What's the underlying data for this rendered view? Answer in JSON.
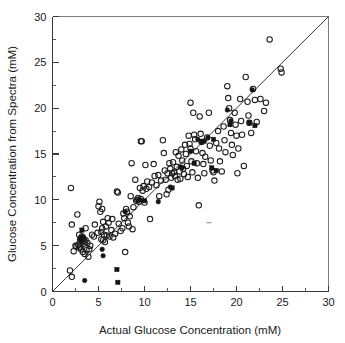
{
  "chart_data": {
    "type": "scatter",
    "title": "",
    "xlabel": "Actual Glucose Concentration (mM)",
    "ylabel": "Glucose Concentration from Spectra (mM)",
    "xlim": [
      0,
      30
    ],
    "ylim": [
      0,
      30
    ],
    "xticks": [
      0,
      5,
      10,
      15,
      20,
      25,
      30
    ],
    "yticks": [
      0,
      5,
      10,
      15,
      20,
      25,
      30
    ],
    "xtick_labels": [
      "0",
      "5",
      "10",
      "15",
      "20",
      "25",
      "30"
    ],
    "ytick_labels": [
      "0",
      "5",
      "10",
      "15",
      "20",
      "25",
      "30"
    ],
    "minor_tick_step": 2.5,
    "grid": false,
    "legend": false,
    "reference_line": {
      "name": "identity-line",
      "type": "line",
      "from": [
        0,
        0
      ],
      "to": [
        30,
        30
      ],
      "slope": 1,
      "intercept": 0,
      "color": "#2b2b2b"
    },
    "series": [
      {
        "name": "open-circle",
        "marker": "open circle",
        "color": "#1c1c1c",
        "points": [
          [
            1.9,
            2.3
          ],
          [
            2.1,
            1.6
          ],
          [
            2.0,
            11.3
          ],
          [
            2.1,
            7.3
          ],
          [
            2.3,
            4.4
          ],
          [
            2.5,
            5.0
          ],
          [
            2.6,
            4.9
          ],
          [
            2.7,
            8.4
          ],
          [
            2.8,
            5.1
          ],
          [
            2.9,
            4.8
          ],
          [
            2.9,
            6.2
          ],
          [
            3.0,
            4.9
          ],
          [
            3.0,
            5.6
          ],
          [
            3.1,
            5.8
          ],
          [
            3.1,
            4.6
          ],
          [
            3.2,
            5.5
          ],
          [
            3.2,
            6.0
          ],
          [
            3.3,
            5.9
          ],
          [
            3.3,
            4.3
          ],
          [
            3.4,
            5.2
          ],
          [
            3.4,
            5.7
          ],
          [
            3.5,
            5.4
          ],
          [
            3.5,
            4.1
          ],
          [
            3.6,
            5.6
          ],
          [
            3.6,
            6.9
          ],
          [
            3.7,
            4.5
          ],
          [
            3.8,
            5.3
          ],
          [
            3.9,
            3.8
          ],
          [
            4.0,
            4.6
          ],
          [
            4.1,
            5.0
          ],
          [
            4.3,
            6.2
          ],
          [
            4.5,
            6.0
          ],
          [
            4.6,
            7.3
          ],
          [
            4.9,
            6.4
          ],
          [
            5.0,
            9.3
          ],
          [
            5.1,
            9.8
          ],
          [
            5.2,
            8.7
          ],
          [
            5.3,
            6.5
          ],
          [
            5.3,
            5.7
          ],
          [
            5.4,
            9.0
          ],
          [
            5.4,
            6.9
          ],
          [
            5.5,
            7.6
          ],
          [
            5.5,
            5.6
          ],
          [
            5.6,
            6.2
          ],
          [
            5.7,
            5.4
          ],
          [
            5.8,
            7.1
          ],
          [
            5.9,
            6.1
          ],
          [
            6.0,
            8.0
          ],
          [
            6.1,
            7.5
          ],
          [
            6.2,
            6.0
          ],
          [
            6.4,
            6.7
          ],
          [
            6.5,
            7.9
          ],
          [
            6.6,
            5.9
          ],
          [
            6.8,
            6.3
          ],
          [
            7.0,
            10.9
          ],
          [
            7.1,
            10.8
          ],
          [
            7.2,
            7.4
          ],
          [
            7.4,
            6.6
          ],
          [
            7.6,
            6.9
          ],
          [
            7.7,
            8.5
          ],
          [
            7.8,
            8.0
          ],
          [
            7.9,
            4.3
          ],
          [
            8.0,
            9.0
          ],
          [
            8.1,
            8.7
          ],
          [
            8.2,
            7.5
          ],
          [
            8.3,
            7.1
          ],
          [
            8.4,
            8.2
          ],
          [
            8.5,
            10.4
          ],
          [
            8.6,
            14.0
          ],
          [
            8.7,
            6.8
          ],
          [
            8.8,
            9.2
          ],
          [
            9.0,
            12.2
          ],
          [
            9.1,
            9.9
          ],
          [
            9.2,
            10.0
          ],
          [
            9.3,
            10.2
          ],
          [
            9.4,
            9.8
          ],
          [
            9.5,
            11.3
          ],
          [
            9.6,
            10.1
          ],
          [
            9.6,
            16.4
          ],
          [
            9.7,
            16.4
          ],
          [
            9.8,
            11.0
          ],
          [
            9.9,
            11.5
          ],
          [
            10.0,
            9.7
          ],
          [
            10.1,
            13.8
          ],
          [
            10.2,
            11.2
          ],
          [
            10.3,
            12.0
          ],
          [
            10.5,
            11.4
          ],
          [
            10.6,
            7.9
          ],
          [
            10.8,
            11.9
          ],
          [
            11.0,
            13.9
          ],
          [
            11.1,
            12.6
          ],
          [
            11.3,
            11.6
          ],
          [
            11.5,
            12.7
          ],
          [
            11.6,
            10.4
          ],
          [
            11.8,
            12.1
          ],
          [
            12.0,
            16.5
          ],
          [
            12.1,
            15.1
          ],
          [
            12.2,
            13.2
          ],
          [
            12.3,
            12.2
          ],
          [
            12.4,
            10.6
          ],
          [
            12.5,
            12.9
          ],
          [
            12.6,
            11.1
          ],
          [
            12.7,
            14.0
          ],
          [
            12.8,
            13.4
          ],
          [
            12.9,
            12.4
          ],
          [
            13.0,
            12.9
          ],
          [
            13.1,
            14.1
          ],
          [
            13.2,
            13.0
          ],
          [
            13.3,
            12.6
          ],
          [
            13.4,
            15.2
          ],
          [
            13.5,
            13.6
          ],
          [
            13.6,
            12.2
          ],
          [
            13.7,
            14.8
          ],
          [
            13.8,
            13.1
          ],
          [
            13.9,
            12.3
          ],
          [
            14.0,
            15.5
          ],
          [
            14.1,
            14.3
          ],
          [
            14.2,
            13.4
          ],
          [
            14.3,
            12.8
          ],
          [
            14.4,
            16.0
          ],
          [
            14.5,
            15.0
          ],
          [
            14.6,
            13.7
          ],
          [
            14.7,
            12.5
          ],
          [
            14.8,
            17.0
          ],
          [
            14.9,
            16.1
          ],
          [
            15.0,
            20.6
          ],
          [
            15.0,
            15.6
          ],
          [
            15.1,
            14.2
          ],
          [
            15.2,
            13.0
          ],
          [
            15.3,
            19.5
          ],
          [
            15.4,
            17.1
          ],
          [
            15.5,
            16.6
          ],
          [
            15.6,
            15.3
          ],
          [
            15.7,
            14.0
          ],
          [
            15.8,
            12.4
          ],
          [
            15.9,
            9.4
          ],
          [
            16.0,
            19.1
          ],
          [
            16.1,
            17.2
          ],
          [
            16.2,
            16.3
          ],
          [
            16.3,
            15.1
          ],
          [
            16.4,
            13.9
          ],
          [
            16.5,
            12.9
          ],
          [
            16.6,
            14.7
          ],
          [
            16.8,
            16.8
          ],
          [
            17.0,
            19.5
          ],
          [
            17.1,
            15.9
          ],
          [
            17.2,
            14.3
          ],
          [
            17.4,
            13.2
          ],
          [
            17.5,
            13.0
          ],
          [
            17.6,
            12.1
          ],
          [
            17.8,
            16.2
          ],
          [
            18.0,
            17.5
          ],
          [
            18.1,
            15.6
          ],
          [
            18.2,
            14.2
          ],
          [
            18.4,
            13.1
          ],
          [
            18.6,
            18.0
          ],
          [
            18.7,
            16.5
          ],
          [
            18.8,
            15.2
          ],
          [
            19.0,
            22.4
          ],
          [
            19.1,
            21.1
          ],
          [
            19.2,
            20.0
          ],
          [
            19.3,
            18.7
          ],
          [
            19.4,
            17.3
          ],
          [
            19.5,
            16.0
          ],
          [
            19.6,
            14.9
          ],
          [
            19.8,
            19.5
          ],
          [
            19.9,
            18.2
          ],
          [
            20.0,
            17.0
          ],
          [
            20.1,
            12.9
          ],
          [
            20.2,
            15.6
          ],
          [
            20.4,
            21.0
          ],
          [
            20.5,
            18.6
          ],
          [
            20.6,
            17.1
          ],
          [
            20.8,
            13.7
          ],
          [
            21.0,
            23.4
          ],
          [
            21.2,
            20.7
          ],
          [
            21.3,
            19.2
          ],
          [
            21.4,
            18.4
          ],
          [
            21.6,
            17.3
          ],
          [
            21.8,
            22.1
          ],
          [
            22.0,
            20.9
          ],
          [
            22.2,
            18.5
          ],
          [
            22.6,
            21.0
          ],
          [
            23.0,
            19.7
          ],
          [
            23.2,
            20.6
          ],
          [
            23.6,
            27.5
          ],
          [
            24.8,
            24.3
          ],
          [
            24.9,
            23.9
          ]
        ]
      },
      {
        "name": "filled-circle",
        "marker": "filled circle",
        "color": "#141414",
        "points": [
          [
            3.0,
            5.8
          ],
          [
            3.1,
            5.6
          ],
          [
            3.2,
            5.9
          ],
          [
            3.5,
            1.2
          ],
          [
            5.4,
            4.6
          ],
          [
            5.5,
            3.9
          ],
          [
            7.9,
            8.7
          ],
          [
            9.3,
            9.9
          ],
          [
            9.5,
            10.0
          ],
          [
            11.5,
            9.8
          ],
          [
            12.8,
            11.4
          ],
          [
            13.9,
            13.6
          ],
          [
            14.1,
            13.5
          ],
          [
            15.8,
            16.6
          ],
          [
            16.2,
            16.3
          ],
          [
            16.9,
            16.8
          ],
          [
            19.0,
            19.8
          ],
          [
            19.4,
            18.6
          ],
          [
            21.7,
            22.0
          ]
        ]
      },
      {
        "name": "filled-square",
        "marker": "filled square",
        "color": "#141414",
        "points": [
          [
            3.2,
            6.7
          ],
          [
            7.0,
            2.4
          ],
          [
            7.1,
            1.0
          ],
          [
            10.0,
            9.9
          ],
          [
            13.0,
            11.3
          ],
          [
            15.0,
            15.3
          ],
          [
            15.4,
            14.0
          ],
          [
            16.5,
            16.4
          ],
          [
            17.3,
            13.5
          ],
          [
            17.5,
            16.6
          ],
          [
            17.8,
            13.2
          ],
          [
            19.3,
            18.2
          ],
          [
            21.4,
            18.4
          ],
          [
            22.0,
            18.1
          ]
        ]
      }
    ],
    "artifacts": [
      {
        "name": "stray-mark",
        "x": 17.0,
        "y": 7.5
      }
    ]
  },
  "axes": {
    "x_title": "Actual Glucose Concentration (mM)",
    "y_title": "Glucose Concentration from Spectra (mM)"
  }
}
